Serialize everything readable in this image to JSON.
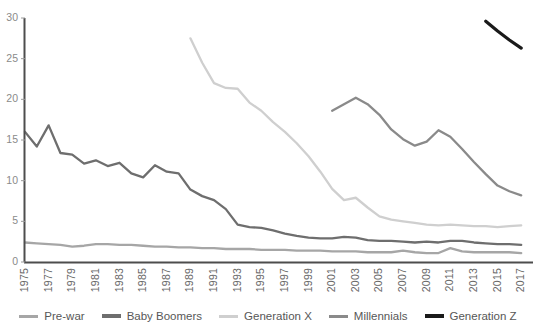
{
  "chart_data": {
    "type": "line",
    "title": "",
    "subtitle": "",
    "xlabel": "",
    "ylabel": "",
    "grid": false,
    "legend_position": "bottom",
    "xlim": [
      1975,
      2018
    ],
    "ylim": [
      0,
      30
    ],
    "x_tick_labels": [
      "1975",
      "1977",
      "1979",
      "1981",
      "1983",
      "1985",
      "1987",
      "1989",
      "1991",
      "1993",
      "1995",
      "1997",
      "1999",
      "2001",
      "2003",
      "2005",
      "2007",
      "2009",
      "2011",
      "2013",
      "2015",
      "2017"
    ],
    "y_tick_labels": [
      "0",
      "5",
      "10",
      "15",
      "20",
      "25",
      "30"
    ],
    "series": [
      {
        "name": "Pre-war",
        "color": "#a6a6a6",
        "x": [
          1975,
          1976,
          1977,
          1978,
          1979,
          1980,
          1981,
          1982,
          1983,
          1984,
          1985,
          1986,
          1987,
          1988,
          1989,
          1990,
          1991,
          1992,
          1993,
          1994,
          1995,
          1996,
          1997,
          1998,
          1999,
          2000,
          2001,
          2002,
          2003,
          2004,
          2005,
          2006,
          2007,
          2008,
          2009,
          2010,
          2011,
          2012,
          2013,
          2014,
          2015,
          2016,
          2017
        ],
        "y": [
          2.4,
          2.3,
          2.2,
          2.1,
          1.9,
          2.0,
          2.2,
          2.2,
          2.1,
          2.1,
          2.0,
          1.9,
          1.9,
          1.8,
          1.8,
          1.7,
          1.7,
          1.6,
          1.6,
          1.6,
          1.5,
          1.5,
          1.5,
          1.4,
          1.4,
          1.4,
          1.3,
          1.3,
          1.3,
          1.2,
          1.2,
          1.2,
          1.4,
          1.2,
          1.1,
          1.1,
          1.7,
          1.3,
          1.2,
          1.2,
          1.2,
          1.2,
          1.1
        ]
      },
      {
        "name": "Baby Boomers",
        "color": "#6e6e6e",
        "x": [
          1975,
          1976,
          1977,
          1978,
          1979,
          1980,
          1981,
          1982,
          1983,
          1984,
          1985,
          1986,
          1987,
          1988,
          1989,
          1990,
          1991,
          1992,
          1993,
          1994,
          1995,
          1996,
          1997,
          1998,
          1999,
          2000,
          2001,
          2002,
          2003,
          2004,
          2005,
          2006,
          2007,
          2008,
          2009,
          2010,
          2011,
          2012,
          2013,
          2014,
          2015,
          2016,
          2017
        ],
        "y": [
          16.0,
          14.2,
          16.8,
          13.4,
          13.2,
          12.1,
          12.5,
          11.8,
          12.2,
          10.9,
          10.4,
          11.9,
          11.1,
          10.9,
          8.9,
          8.1,
          7.6,
          6.5,
          4.6,
          4.3,
          4.2,
          3.9,
          3.5,
          3.2,
          3.0,
          2.9,
          2.9,
          3.1,
          3.0,
          2.7,
          2.6,
          2.6,
          2.5,
          2.4,
          2.5,
          2.4,
          2.6,
          2.6,
          2.4,
          2.3,
          2.2,
          2.2,
          2.1
        ]
      },
      {
        "name": "Generation X",
        "color": "#cfcfcf",
        "x": [
          1989,
          1990,
          1991,
          1992,
          1993,
          1994,
          1995,
          1996,
          1997,
          1998,
          1999,
          2000,
          2001,
          2002,
          2003,
          2004,
          2005,
          2006,
          2007,
          2008,
          2009,
          2010,
          2011,
          2012,
          2013,
          2014,
          2015,
          2016,
          2017
        ],
        "y": [
          27.5,
          24.5,
          22.0,
          21.4,
          21.3,
          19.6,
          18.6,
          17.2,
          16.0,
          14.6,
          13.0,
          11.1,
          9.0,
          7.6,
          7.9,
          6.7,
          5.6,
          5.2,
          5.0,
          4.8,
          4.6,
          4.5,
          4.6,
          4.5,
          4.4,
          4.4,
          4.3,
          4.4,
          4.5
        ]
      },
      {
        "name": "Millennials",
        "color": "#8a8a8a",
        "x": [
          2001,
          2002,
          2003,
          2004,
          2005,
          2006,
          2007,
          2008,
          2009,
          2010,
          2011,
          2012,
          2013,
          2014,
          2015,
          2016,
          2017
        ],
        "y": [
          18.6,
          19.4,
          20.2,
          19.4,
          18.1,
          16.3,
          15.1,
          14.3,
          14.8,
          16.2,
          15.4,
          13.9,
          12.3,
          10.8,
          9.4,
          8.7,
          8.2
        ]
      },
      {
        "name": "Generation Z",
        "color": "#1a1a1a",
        "x": [
          2014,
          2015,
          2016,
          2017
        ],
        "y": [
          29.6,
          28.4,
          27.3,
          26.3
        ]
      }
    ]
  },
  "legend": {
    "items": [
      {
        "label": "Pre-war",
        "color": "#a6a6a6"
      },
      {
        "label": "Baby Boomers",
        "color": "#6e6e6e"
      },
      {
        "label": "Generation X",
        "color": "#cfcfcf"
      },
      {
        "label": "Millennials",
        "color": "#8a8a8a"
      },
      {
        "label": "Generation Z",
        "color": "#1a1a1a"
      }
    ]
  },
  "axes": {
    "x_labels": [
      "1975",
      "1977",
      "1979",
      "1981",
      "1983",
      "1985",
      "1987",
      "1989",
      "1991",
      "1993",
      "1995",
      "1997",
      "1999",
      "2001",
      "2003",
      "2005",
      "2007",
      "2009",
      "2011",
      "2013",
      "2015",
      "2017"
    ],
    "y_labels": [
      "0",
      "5",
      "10",
      "15",
      "20",
      "25",
      "30"
    ],
    "axis_color": "#4d4d4d"
  }
}
